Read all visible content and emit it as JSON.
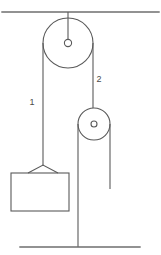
{
  "diagram": {
    "type": "physics-free-body-diagram",
    "stroke_color": "#5a5a5a",
    "structure_color": "#6e6e6e",
    "background_color": "#ffffff"
  },
  "labels": {
    "rope_1": "1",
    "rope_2": "2"
  },
  "supports": {
    "ceiling": {
      "name": "ceiling",
      "x1": 2,
      "y1": 12,
      "x2": 159,
      "y2": 12
    },
    "floor": {
      "name": "floor",
      "x1": 20,
      "y1": 247,
      "x2": 140,
      "y2": 247
    },
    "hanger_rod": {
      "name": "ceiling-hanger-rod",
      "x1": 68,
      "y1": 12,
      "x2": 68,
      "y2": 43
    },
    "floor_post": {
      "name": "floor-anchor-post",
      "x1": 78,
      "y1": 124,
      "x2": 78,
      "y2": 247
    }
  },
  "pulleys": [
    {
      "name": "fixed-pulley-top",
      "cx": 68,
      "cy": 43,
      "radius": 25,
      "hub_radius": 3.6
    },
    {
      "name": "movable-pulley-lower",
      "cx": 94,
      "cy": 124,
      "radius": 16,
      "hub_radius": 3.0
    }
  ],
  "ropes": [
    {
      "name": "rope-1-left-segment",
      "label": "1",
      "label_x": 32,
      "label_y": 105,
      "x1": 43,
      "y1": 43,
      "x2": 43,
      "y2": 166
    },
    {
      "name": "rope-2-right-segment",
      "label": "2",
      "label_x": 99,
      "label_y": 82,
      "x1": 93,
      "y1": 43,
      "x2": 93,
      "y2": 108
    },
    {
      "name": "rope-free-end",
      "label": "",
      "label_x": 0,
      "label_y": 0,
      "x1": 110,
      "y1": 124,
      "x2": 110,
      "y2": 189
    }
  ],
  "block": {
    "name": "suspended-block",
    "x": 11,
    "y": 173,
    "width": 58,
    "height": 38,
    "hook_apex_x": 43,
    "hook_apex_y": 165,
    "hook_left_x": 28,
    "hook_right_x": 58
  }
}
